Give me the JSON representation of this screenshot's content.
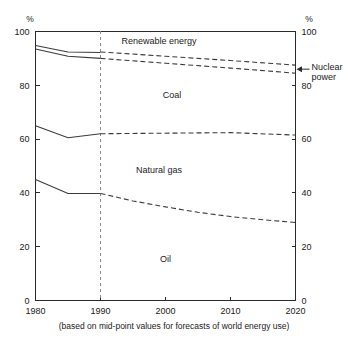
{
  "chart_data": {
    "type": "line",
    "title": "",
    "subtitle": "",
    "caption": "(based on mid-point values for forecasts of world energy use)",
    "xlabel": "",
    "ylabel": "%",
    "ylabel_right": "%",
    "xlim": [
      1980,
      2020
    ],
    "ylim": [
      0,
      100
    ],
    "grid": false,
    "legend_position": "inline-band-labels",
    "x_ticks": [
      "1980",
      "1990",
      "2000",
      "2010",
      "2020"
    ],
    "x_tick_values": [
      1980,
      1990,
      2000,
      2010,
      2020
    ],
    "y_ticks": [
      "0",
      "20",
      "40",
      "60",
      "80",
      "100"
    ],
    "y_tick_values": [
      0,
      20,
      40,
      60,
      80,
      100
    ],
    "y_ticks_right": [
      "0",
      "20",
      "40",
      "60",
      "80",
      "100"
    ],
    "history_forecast_divider_x": 1990,
    "series": [
      {
        "name": "Oil (upper boundary)",
        "band_label": "Oil",
        "history": {
          "x": [
            1980,
            1985,
            1990
          ],
          "values": [
            45.0,
            39.8,
            39.8
          ]
        },
        "forecast": {
          "x": [
            1990,
            1995,
            2000,
            2005,
            2010,
            2015,
            2020
          ],
          "values": [
            39.8,
            37.0,
            34.8,
            32.8,
            31.2,
            30.0,
            29.0
          ]
        }
      },
      {
        "name": "Natural gas (upper boundary)",
        "band_label": "Natural gas",
        "history": {
          "x": [
            1980,
            1985,
            1990
          ],
          "values": [
            65.0,
            60.5,
            62.0
          ]
        },
        "forecast": {
          "x": [
            1990,
            2000,
            2010,
            2020
          ],
          "values": [
            62.0,
            62.2,
            62.4,
            61.5
          ]
        }
      },
      {
        "name": "Coal (upper boundary)",
        "band_label": "Coal",
        "history": {
          "x": [
            1980,
            1985,
            1990
          ],
          "values": [
            93.5,
            90.8,
            90.0
          ]
        },
        "forecast": {
          "x": [
            1990,
            2000,
            2010,
            2020
          ],
          "values": [
            90.0,
            88.2,
            86.4,
            84.5
          ]
        }
      },
      {
        "name": "Renewable energy (upper boundary)",
        "band_label": "Renewable energy",
        "history": {
          "x": [
            1980,
            1985,
            1990
          ],
          "values": [
            94.8,
            92.4,
            92.2
          ]
        },
        "forecast": {
          "x": [
            1990,
            2000,
            2010,
            2020
          ],
          "values": [
            92.4,
            90.8,
            89.2,
            87.5
          ]
        }
      }
    ],
    "annotations": [
      {
        "text_line_1": "Nuclear",
        "text_line_2": "power",
        "target_value": 86.0,
        "target_x": 2020,
        "type": "arrow-label"
      }
    ],
    "band_labels": [
      {
        "text": "Renewable energy",
        "x": 1999,
        "y": 96.5
      },
      {
        "text": "Coal",
        "x": 2001,
        "y": 76.5
      },
      {
        "text": "Natural gas",
        "x": 1999,
        "y": 48.5
      },
      {
        "text": "Oil",
        "x": 2000,
        "y": 15.5
      }
    ],
    "colors": {
      "line": "#3a3a3a",
      "axis": "#2a2a2a",
      "divider": "#8a8a8a",
      "background": "#ffffff",
      "text": "#1a1a1a"
    }
  }
}
